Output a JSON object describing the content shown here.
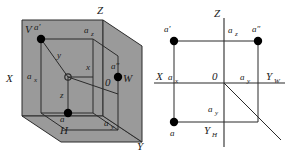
{
  "figure": {
    "background_color": "#ffffff",
    "plane_fill": "#9a9a9a",
    "line_color": "#2b2b2b",
    "point_color": "#000000"
  },
  "left_diagram": {
    "name": "pictorial-projection-box",
    "plane_labels": {
      "vertical_plane": "V",
      "horizontal_plane": "H",
      "profile_plane": "W"
    },
    "axis_labels": {
      "x": "X",
      "y": "Y",
      "z": "Z"
    },
    "origin_label": "0",
    "point_labels": {
      "point": "a",
      "front_view": "a'",
      "profile_view": "a″"
    },
    "coordinate_labels": {
      "ax": "a",
      "ax_sub": "x",
      "ay": "a",
      "ay_sub": "y",
      "az": "a",
      "az_sub": "z"
    },
    "dimension_labels": {
      "x": "x",
      "y": "y",
      "z": "z"
    }
  },
  "right_diagram": {
    "name": "epure-multiview",
    "axis_labels": {
      "x": "X",
      "z": "Z",
      "y_w": "Y",
      "y_w_sub": "W",
      "y_h": "Y",
      "y_h_sub": "H"
    },
    "origin_label": "0",
    "point_labels": {
      "point": "a",
      "front_view": "a'",
      "profile_view": "a″"
    },
    "coordinate_labels": {
      "ax": "a",
      "ax_sub": "x",
      "ay_right": "a",
      "ay_right_sub": "y",
      "ay_bottom": "a",
      "ay_bottom_sub": "y",
      "az": "a",
      "az_sub": "z"
    }
  }
}
